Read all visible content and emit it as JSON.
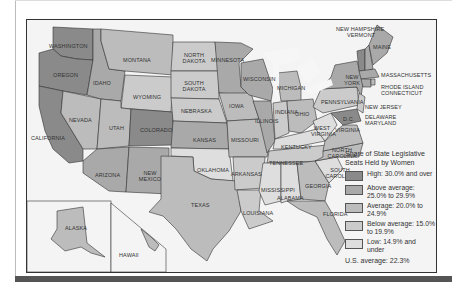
{
  "colors": {
    "high": "#8a8a8a",
    "above_average": "#a9a9a9",
    "average": "#bcbcbc",
    "below_average": "#cbcbcb",
    "low": "#dedede",
    "water": "#f6f6f6",
    "frame": "#333333"
  },
  "legend": {
    "title": "Share of State Legislative Seats Held by Women",
    "items": [
      {
        "label": "High: 30.0% and over",
        "category": "high"
      },
      {
        "label": "Above average: 25.0% to 29.9%",
        "category": "above_average"
      },
      {
        "label": "Average: 20.0% to 24.9%",
        "category": "average"
      },
      {
        "label": "Below average: 15.0% to 19.9%",
        "category": "below_average"
      },
      {
        "label": "Low: 14.9% and under",
        "category": "low"
      }
    ],
    "us_average": "U.S. average: 22.3%"
  },
  "states": {
    "washington": "WASHINGTON",
    "oregon": "OREGON",
    "california": "CALIFORNIA",
    "nevada": "NEVADA",
    "idaho": "IDAHO",
    "montana": "MONTANA",
    "wyoming": "WYOMING",
    "utah": "UTAH",
    "colorado": "COLORADO",
    "arizona": "ARIZONA",
    "new_mexico": "NEW MEXICO",
    "north_dakota": "NORTH DAKOTA",
    "south_dakota": "SOUTH DAKOTA",
    "nebraska": "NEBRASKA",
    "kansas": "KANSAS",
    "oklahoma": "OKLAHOMA",
    "texas": "TEXAS",
    "minnesota": "MINNESOTA",
    "iowa": "IOWA",
    "missouri": "MISSOURI",
    "arkansas": "ARKANSAS",
    "louisiana": "LOUISIANA",
    "wisconsin": "WISCONSIN",
    "illinois": "ILLINOIS",
    "michigan": "MICHIGAN",
    "indiana": "INDIANA",
    "ohio": "OHIO",
    "kentucky": "KENTUCKY",
    "tennessee": "TENNESSEE",
    "mississippi": "MISSISSIPPI",
    "alabama": "ALABAMA",
    "georgia": "GEORGIA",
    "florida": "FLORIDA",
    "south_carolina": "SOUTH CAROLINA",
    "north_carolina": "NORTH CAROLINA",
    "virginia": "VIRGINIA",
    "west_virginia": "WEST VIRGINIA",
    "pennsylvania": "PENNSYLVANIA",
    "new_york": "NEW YORK",
    "maine": "MAINE",
    "new_hampshire": "NEW HAMPSHIRE",
    "vermont": "VERMONT",
    "massachusetts": "MASSACHUSETTS",
    "rhode_island": "RHODE ISLAND",
    "connecticut": "CONNECTICUT",
    "new_jersey": "NEW JERSEY",
    "delaware": "DELAWARE",
    "maryland": "MARYLAND",
    "dc": "D.C.",
    "alaska": "ALASKA",
    "hawaii": "HAWAII"
  }
}
